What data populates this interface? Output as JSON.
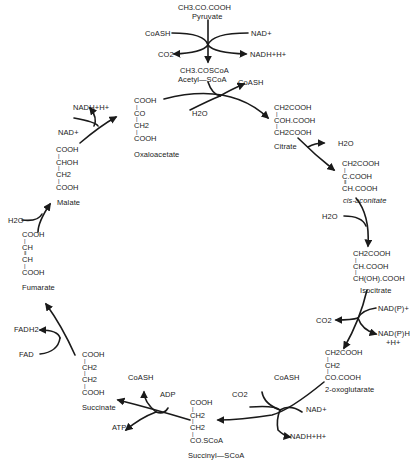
{
  "diagram": {
    "type": "citric-acid-cycle",
    "colors": {
      "ink": "#1a1a1a",
      "background": "#ffffff"
    },
    "compounds": {
      "pyruvate": {
        "formula": [
          "CH3.CO.COOH"
        ],
        "name": "Pyruvate"
      },
      "acetyl_scoa": {
        "formula": [
          "CH3.COSCoA"
        ],
        "name": "Acetyl—SCoA"
      },
      "citrate": {
        "formula": [
          "CH2COOH",
          "COH.COOH",
          "CH2COOH"
        ],
        "name": "Citrate"
      },
      "cis_aconitate": {
        "formula": [
          "CH2COOH",
          "C.COOH",
          "CH.COOH"
        ],
        "name": "cis-aconitate"
      },
      "isocitrate": {
        "formula": [
          "CH2COOH",
          "CH.COOH",
          "CH(OH).COOH"
        ],
        "name": "Isocitrate"
      },
      "oxoglutarate": {
        "formula": [
          "CH2COOH",
          "CH2",
          "CO.COOH"
        ],
        "name": "2-oxoglutarate"
      },
      "succinyl_scoa": {
        "formula": [
          "COOH",
          "CH2",
          "CH2",
          "CO.SCoA"
        ],
        "name": "Succinyl—SCoA"
      },
      "succinate": {
        "formula": [
          "COOH",
          "CH2",
          "CH2",
          "COOH"
        ],
        "name": "Succinate"
      },
      "fumarate": {
        "formula": [
          "COOH",
          "CH",
          "CH",
          "COOH"
        ],
        "name": "Fumarate"
      },
      "malate": {
        "formula": [
          "COOH",
          "CHOH",
          "CH2",
          "COOH"
        ],
        "name": "Malate"
      },
      "oxaloacetate": {
        "formula": [
          "COOH",
          "CO",
          "CH2",
          "COOH"
        ],
        "name": "Oxaloacetate"
      }
    },
    "cofactors": {
      "pdh_coash": "CoASH",
      "pdh_nad": "NAD+",
      "pdh_co2": "CO2",
      "pdh_nadh": "NADH+H+",
      "cs_coash": "CoASH",
      "cs_h2o": "H2O",
      "acon1_h2o": "H2O",
      "acon2_h2o": "H2O",
      "idh_nadp": "NAD(P)+",
      "idh_co2": "CO2",
      "idh_nadph": "NAD(P)H",
      "idh_h": "+H+",
      "ogdh_coash": "CoASH",
      "ogdh_co2": "CO2",
      "ogdh_nad": "NAD+",
      "ogdh_nadh": "NADH+H+",
      "scs_coash": "CoASH",
      "scs_adp": "ADP",
      "scs_atp": "ATP",
      "sdh_fadh2": "FADH2",
      "sdh_fad": "FAD",
      "fum_h2o": "H2O",
      "mdh_nadh": "NADH+H+",
      "mdh_nad": "NAD+"
    }
  }
}
